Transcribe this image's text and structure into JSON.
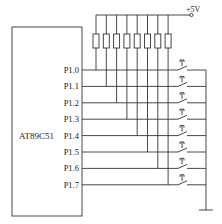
{
  "diagram": {
    "chip_label": "AT89C51",
    "supply_label": "+5V",
    "pins": [
      "P1.0",
      "P1.1",
      "P1.2",
      "P1.3",
      "P1.4",
      "P1.5",
      "P1.6",
      "P1.7"
    ],
    "resistor_count": 8,
    "switch_count": 8,
    "ground": "ground-symbol",
    "colors": {
      "line": "#333333",
      "text": "#222222",
      "background": "#ffffff"
    }
  }
}
